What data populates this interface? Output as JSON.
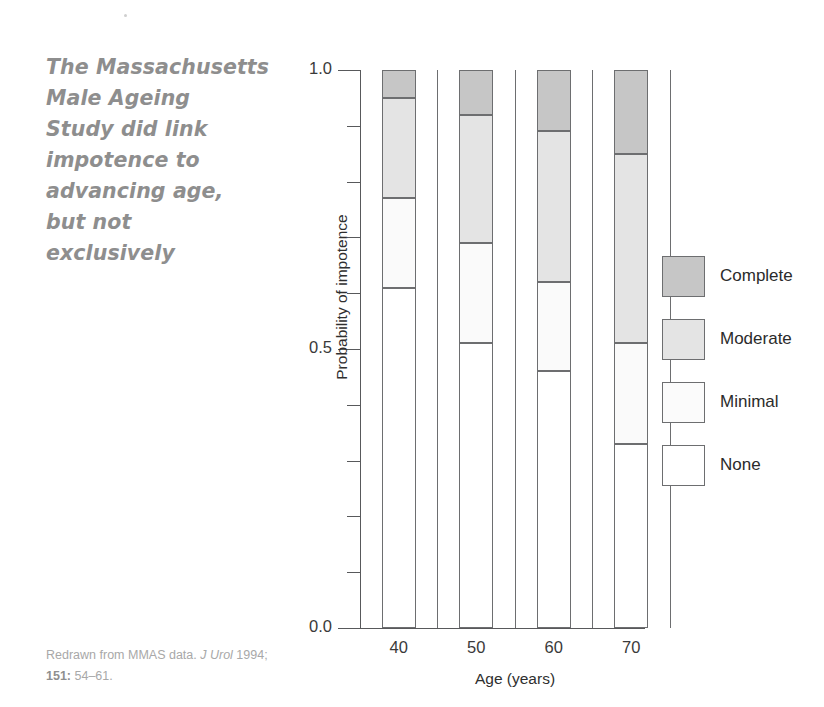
{
  "pullquote": {
    "lines": [
      "The Massachusetts",
      "Male Ageing",
      "Study did link",
      "impotence to",
      "advancing age,",
      "but not",
      "exclusively"
    ]
  },
  "caption": {
    "line1_prefix": "Redrawn from MMAS data. ",
    "line1_journal": "J Urol",
    "line1_suffix": " 1994;",
    "line2_volume": "151:",
    "line2_pages": " 54–61."
  },
  "chart_data": {
    "type": "bar",
    "subtype": "stacked-vertical",
    "title": "",
    "xlabel": "Age (years)",
    "ylabel": "Probability of impotence",
    "categories": [
      "40",
      "50",
      "60",
      "70"
    ],
    "ylim": [
      0.0,
      1.0
    ],
    "ytick_labels": [
      "0.0",
      "0.5",
      "1.0"
    ],
    "ytick_values": [
      0.0,
      0.5,
      1.0
    ],
    "yminor_values": [
      0.1,
      0.2,
      0.3,
      0.4,
      0.6,
      0.7,
      0.8,
      0.9
    ],
    "grid": false,
    "legend_position": "right",
    "series": [
      {
        "name": "None",
        "key": "none",
        "color": "#ffffff",
        "values": [
          0.61,
          0.51,
          0.46,
          0.33
        ]
      },
      {
        "name": "Minimal",
        "key": "minimal",
        "color": "#fafafa",
        "values": [
          0.16,
          0.18,
          0.16,
          0.18
        ]
      },
      {
        "name": "Moderate",
        "key": "moderate",
        "color": "#e4e4e4",
        "values": [
          0.18,
          0.23,
          0.27,
          0.34
        ]
      },
      {
        "name": "Complete",
        "key": "complete",
        "color": "#c6c6c6",
        "values": [
          0.05,
          0.08,
          0.11,
          0.15
        ]
      }
    ],
    "cumulative_tops": {
      "40": {
        "none": 0.61,
        "minimal": 0.77,
        "moderate": 0.95,
        "complete": 1.0
      },
      "50": {
        "none": 0.51,
        "minimal": 0.69,
        "moderate": 0.92,
        "complete": 1.0
      },
      "60": {
        "none": 0.46,
        "minimal": 0.62,
        "moderate": 0.89,
        "complete": 1.0
      },
      "70": {
        "none": 0.33,
        "minimal": 0.51,
        "moderate": 0.85,
        "complete": 1.0
      }
    }
  },
  "legend": {
    "entries": [
      {
        "label": "Complete",
        "key": "complete"
      },
      {
        "label": "Moderate",
        "key": "moderate"
      },
      {
        "label": "Minimal",
        "key": "minimal"
      },
      {
        "label": "None",
        "key": "none"
      }
    ]
  }
}
